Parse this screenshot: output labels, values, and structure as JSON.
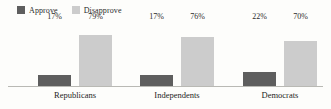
{
  "chart_data": {
    "type": "bar",
    "title": "",
    "subtitle": "",
    "xlabel": "",
    "ylabel": "",
    "ylim": [
      0,
      100
    ],
    "grid": false,
    "legend_position": "top-left",
    "categories": [
      "Republicans",
      "Independents",
      "Democrats"
    ],
    "series": [
      {
        "name": "Approve",
        "color": "#5e5e5e",
        "values": [
          17,
          17,
          22
        ],
        "labels": [
          "17%",
          "17%",
          "22%"
        ]
      },
      {
        "name": "Disapprove",
        "color": "#cccccc",
        "values": [
          79,
          76,
          70
        ],
        "labels": [
          "79%",
          "76%",
          "70%"
        ]
      }
    ]
  },
  "legend": {
    "items": [
      {
        "label": "Approve",
        "color": "#5e5e5e",
        "swatch": "legend-swatch-approve"
      },
      {
        "label": "Disapprove",
        "color": "#cccccc",
        "swatch": "legend-swatch-disapprove"
      }
    ]
  },
  "axis": {
    "baseline_color": "#b9b9b4"
  },
  "groups": [
    {
      "label": "Republicans",
      "bars": [
        {
          "series": "Approve",
          "value": 17,
          "label": "17%"
        },
        {
          "series": "Disapprove",
          "value": 79,
          "label": "79%"
        }
      ]
    },
    {
      "label": "Independents",
      "bars": [
        {
          "series": "Approve",
          "value": 17,
          "label": "17%"
        },
        {
          "series": "Disapprove",
          "value": 76,
          "label": "76%"
        }
      ]
    },
    {
      "label": "Democrats",
      "bars": [
        {
          "series": "Approve",
          "value": 22,
          "label": "22%"
        },
        {
          "series": "Disapprove",
          "value": 70,
          "label": "70%"
        }
      ]
    }
  ]
}
